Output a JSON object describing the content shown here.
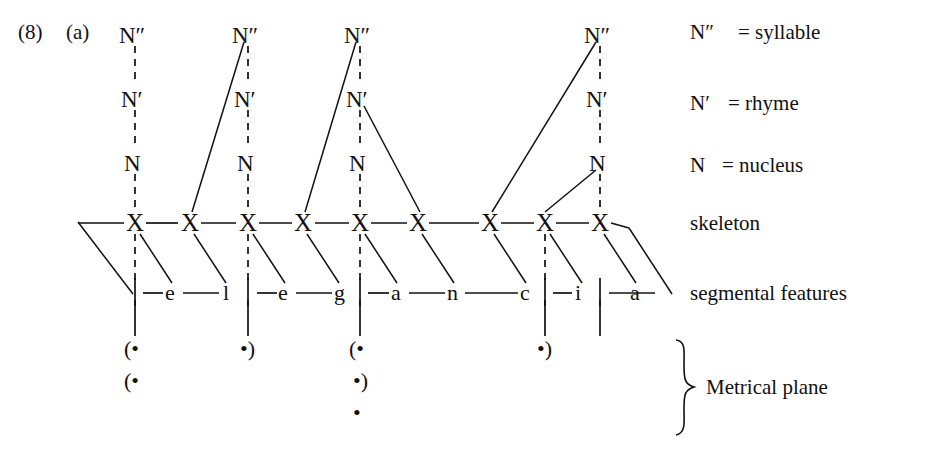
{
  "figure": {
    "number": "(8)",
    "part": "(a)",
    "word": "elegancia",
    "language_note": ""
  },
  "legend": [
    {
      "symbol": "N″",
      "equals": "= syllable"
    },
    {
      "symbol": "N′",
      "equals": "= rhyme"
    },
    {
      "symbol": "N",
      "equals": "= nucleus"
    }
  ],
  "tier_labels": {
    "skeleton": "skeleton",
    "segmental": "segmental features",
    "metrical": "Metrical plane"
  },
  "node_labels": {
    "syllable": "N″",
    "rhyme": "N′",
    "nucleus": "N"
  },
  "skeleton": {
    "slot_label": "X",
    "slots": [
      "X",
      "X",
      "X",
      "X",
      "X",
      "X",
      "X",
      "X",
      "X"
    ]
  },
  "segments": [
    "e",
    "l",
    "e",
    "g",
    "a",
    "n",
    "c",
    "i",
    "a"
  ],
  "syllable_trees": [
    {
      "index": 1,
      "nucleus_slot": 1,
      "has_onset": false,
      "has_coda": false,
      "nodes": [
        "N″",
        "N′",
        "N"
      ]
    },
    {
      "index": 2,
      "nucleus_slot": 3,
      "onset_slot": 2,
      "has_onset": true,
      "has_coda": false,
      "nodes": [
        "N″",
        "N′",
        "N"
      ]
    },
    {
      "index": 3,
      "nucleus_slot": 5,
      "onset_slot": 4,
      "coda_slot": 6,
      "has_onset": true,
      "has_coda": true,
      "nodes": [
        "N″",
        "N′",
        "N"
      ]
    },
    {
      "index": 4,
      "nucleus_slot": 9,
      "onset_slot": 7,
      "glide_slot": 8,
      "has_onset": true,
      "has_coda": false,
      "nodes": [
        "N″",
        "N′",
        "N"
      ]
    }
  ],
  "metrical_grid": {
    "open_paren": "(",
    "close_paren": ")",
    "beat": "•",
    "rows": [
      {
        "level": 1,
        "marks": [
          {
            "slot": 1,
            "text": "(•"
          },
          {
            "slot": 3,
            "text": "•)"
          },
          {
            "slot": 5,
            "text": "(•"
          },
          {
            "slot": 8,
            "text": "•)"
          }
        ]
      },
      {
        "level": 2,
        "marks": [
          {
            "slot": 1,
            "text": "(•"
          },
          {
            "slot": 5,
            "text": "•)"
          }
        ]
      },
      {
        "level": 3,
        "marks": [
          {
            "slot": 5,
            "text": "•"
          }
        ]
      }
    ]
  },
  "colors": {
    "ink": "#111111",
    "paper": "#ffffff"
  }
}
